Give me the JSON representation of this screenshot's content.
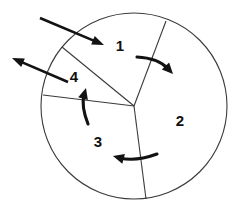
{
  "figure": {
    "type": "sector-diagram",
    "background_color": "#ffffff",
    "line_color": "#3a3a3a",
    "arrow_color": "#121212",
    "label_color": "#101010",
    "circle": {
      "center_x": 134,
      "center_y": 106,
      "radius": 93
    },
    "sectors": [
      {
        "id": "sector-1",
        "label": "1",
        "label_x": 120,
        "label_y": 47
      },
      {
        "id": "sector-2",
        "label": "2",
        "label_x": 180,
        "label_y": 122
      },
      {
        "id": "sector-3",
        "label": "3",
        "label_x": 98,
        "label_y": 143
      },
      {
        "id": "sector-4",
        "label": "4",
        "label_x": 74,
        "label_y": 78
      }
    ],
    "dividers": [
      {
        "id": "divider-1-2",
        "from_x": 134,
        "from_y": 106,
        "to_x": 166,
        "to_y": 21
      },
      {
        "id": "divider-1-4",
        "from_x": 134,
        "from_y": 106,
        "to_x": 62,
        "to_y": 47
      },
      {
        "id": "divider-3-4",
        "from_x": 134,
        "from_y": 106,
        "to_x": 43,
        "to_y": 95
      },
      {
        "id": "divider-2-3",
        "from_x": 134,
        "from_y": 106,
        "to_x": 146,
        "to_y": 199
      }
    ],
    "arrows": [
      {
        "id": "arrow-inward-top-left",
        "kind": "straight",
        "direction": "inward",
        "start_x": 40,
        "start_y": 18,
        "end_x": 104,
        "end_y": 45,
        "head_at": "end"
      },
      {
        "id": "arrow-outward-left",
        "kind": "straight",
        "direction": "outward",
        "start_x": 68,
        "start_y": 82,
        "end_x": 12,
        "end_y": 58,
        "head_at": "end"
      },
      {
        "id": "arrow-curved-sector-1-to-2",
        "kind": "curved",
        "direction": "clockwise",
        "start_x": 137,
        "start_y": 57,
        "control_x": 158,
        "control_y": 58,
        "end_x": 173,
        "end_y": 74,
        "head_at": "end"
      },
      {
        "id": "arrow-curved-sector-2-to-3",
        "kind": "curved",
        "direction": "clockwise",
        "start_x": 157,
        "start_y": 154,
        "control_x": 135,
        "control_y": 162,
        "end_x": 113,
        "end_y": 156,
        "head_at": "end"
      },
      {
        "id": "arrow-curved-sector-3-to-4",
        "kind": "curved",
        "direction": "counterclockwise",
        "start_x": 88,
        "start_y": 124,
        "control_x": 81,
        "control_y": 106,
        "end_x": 86,
        "end_y": 88,
        "head_at": "end"
      }
    ]
  }
}
